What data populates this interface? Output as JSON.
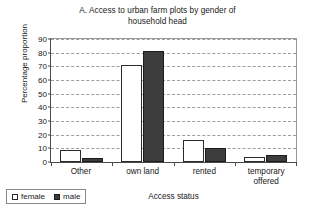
{
  "chart_data": {
    "type": "bar",
    "title": "A. Access to urban farm plots by gender of household head",
    "title_line1": "A. Access to urban farm plots by gender of",
    "title_line2": "household head",
    "xlabel": "Access status",
    "ylabel": "Percentage proportion",
    "ylim": [
      0,
      90
    ],
    "yticks": [
      0,
      10,
      20,
      30,
      40,
      50,
      60,
      70,
      80,
      90
    ],
    "grid": true,
    "legend_position": "bottom-left",
    "categories": [
      "Other",
      "own land",
      "rented",
      "temporary offered"
    ],
    "category_labels": [
      {
        "line1": "Other",
        "line2": ""
      },
      {
        "line1": "own land",
        "line2": ""
      },
      {
        "line1": "rented",
        "line2": ""
      },
      {
        "line1": "temporary",
        "line2": "offered"
      }
    ],
    "series": [
      {
        "name": "female",
        "color": "#ffffff",
        "edge_color": "#2b2b2b",
        "values": [
          9,
          71,
          16,
          4
        ]
      },
      {
        "name": "male",
        "color": "#3d3d3d",
        "edge_color": "#1c1c1c",
        "values": [
          3,
          81,
          10,
          5
        ]
      }
    ]
  },
  "legend": {
    "items": [
      {
        "label": "female",
        "swatch": "white-square-icon"
      },
      {
        "label": "male",
        "swatch": "black-square-icon"
      }
    ]
  }
}
